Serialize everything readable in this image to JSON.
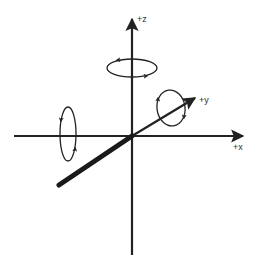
{
  "diagram": {
    "colors": {
      "background": "#ffffff",
      "stroke": "#222222",
      "label": "#333333"
    },
    "axes": {
      "x": {
        "label": "+x",
        "direction": "right"
      },
      "y": {
        "label": "+y",
        "direction": "diagonal-up-right (depth)"
      },
      "z": {
        "label": "+z",
        "direction": "up"
      }
    },
    "rotations": [
      {
        "axis": "x",
        "shape": "vertical-ellipse",
        "position": "left of origin on x-axis"
      },
      {
        "axis": "y",
        "shape": "tilted-ellipse",
        "position": "near +y arrow"
      },
      {
        "axis": "z",
        "shape": "horizontal-ellipse",
        "position": "upper z-axis"
      }
    ]
  }
}
